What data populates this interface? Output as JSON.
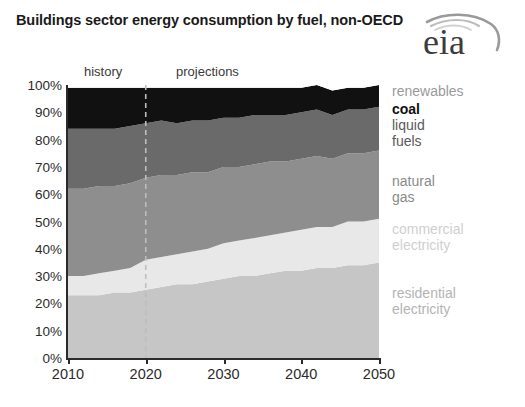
{
  "title": "Buildings sector energy consumption by fuel, non-OECD",
  "logo": {
    "text": "eia",
    "alt": "eia-logo"
  },
  "periods": {
    "history": "history",
    "projections": "projections",
    "divider_year": 2020
  },
  "chart_data": {
    "type": "area",
    "title": "Buildings sector energy consumption by fuel, non-OECD",
    "subtitle": "",
    "xlabel": "",
    "ylabel": "",
    "stacked": true,
    "normalized": true,
    "grid": false,
    "legend_position": "right",
    "xlim": [
      2010,
      2050
    ],
    "ylim": [
      0,
      100
    ],
    "x": [
      2010,
      2012,
      2014,
      2016,
      2018,
      2020,
      2022,
      2024,
      2026,
      2028,
      2030,
      2032,
      2034,
      2036,
      2038,
      2040,
      2042,
      2044,
      2046,
      2048,
      2050
    ],
    "xticks": [
      2010,
      2020,
      2030,
      2040,
      2050
    ],
    "xtick_labels": [
      "2010",
      "2020",
      "2030",
      "2040",
      "2050"
    ],
    "yticks": [
      0,
      10,
      20,
      30,
      40,
      50,
      60,
      70,
      80,
      90,
      100
    ],
    "ytick_labels": [
      "0%",
      "10%",
      "20%",
      "30%",
      "40%",
      "50%",
      "60%",
      "70%",
      "80%",
      "90%",
      "100%"
    ],
    "series": [
      {
        "name": "residential electricity",
        "color": "#c6c6c6",
        "label_color": "#b4b4b4",
        "values": [
          23,
          23,
          23,
          24,
          24,
          25,
          26,
          27,
          27,
          28,
          29,
          30,
          30,
          31,
          32,
          32,
          33,
          33,
          34,
          34,
          35
        ]
      },
      {
        "name": "commercial electricity",
        "color": "#e8e8e8",
        "label_color": "#cfcfcf",
        "values": [
          7,
          7,
          8,
          8,
          9,
          11,
          11,
          11,
          12,
          12,
          13,
          13,
          14,
          14,
          14,
          15,
          15,
          15,
          16,
          16,
          16
        ]
      },
      {
        "name": "natural gas",
        "color": "#8e8e8e",
        "label_color": "#8a8a8a",
        "values": [
          32,
          32,
          32,
          31,
          31,
          30,
          30,
          29,
          29,
          28,
          28,
          27,
          27,
          27,
          26,
          26,
          26,
          25,
          25,
          25,
          25
        ]
      },
      {
        "name": "liquid fuels",
        "color": "#6a6a6a",
        "label_color": "#5a5a5a",
        "values": [
          22,
          22,
          21,
          21,
          21,
          20,
          20,
          19,
          19,
          19,
          18,
          18,
          18,
          17,
          17,
          17,
          17,
          16,
          16,
          16,
          16
        ]
      },
      {
        "name": "coal",
        "color": "#111111",
        "label_color": "#111111",
        "values": [
          15,
          15,
          15,
          15,
          14,
          13,
          12,
          13,
          12,
          12,
          11,
          11,
          10,
          10,
          10,
          9,
          9,
          9,
          8,
          8,
          8
        ]
      },
      {
        "name": "renewables",
        "color": "#ffffff",
        "label_color": "#9a9a9a",
        "values": [
          1,
          1,
          1,
          1,
          1,
          1,
          1,
          1,
          1,
          1,
          1,
          1,
          1,
          1,
          1,
          1,
          1,
          1,
          1,
          1,
          0
        ]
      }
    ],
    "label_positions": [
      {
        "name": "renewables",
        "top": 14
      },
      {
        "name": "coal",
        "top": 32
      },
      {
        "name": "liquid fuels",
        "top": 48
      },
      {
        "name": "natural gas",
        "top": 104
      },
      {
        "name": "commercial electricity",
        "top": 152
      },
      {
        "name": "residential electricity",
        "top": 216
      }
    ]
  }
}
